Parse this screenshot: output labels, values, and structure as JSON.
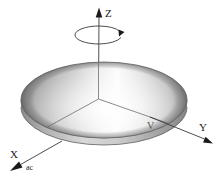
{
  "figure": {
    "background_color": "#ffffff",
    "width": 220,
    "height": 178
  },
  "axes": {
    "z": {
      "label": "Z",
      "icon": "arrow-up-icon",
      "direction": "up",
      "tip": {
        "x": 99,
        "y": 9
      },
      "origin": {
        "x": 98,
        "y": 99
      },
      "label_pos": {
        "x": 105,
        "y": 17
      }
    },
    "y": {
      "label": "Y",
      "icon": "arrow-down-right-icon",
      "direction": "lower-right",
      "tip": {
        "x": 211,
        "y": 143
      },
      "origin": {
        "x": 98,
        "y": 99
      },
      "label_pos": {
        "x": 201,
        "y": 130
      }
    },
    "x": {
      "label": "X",
      "icon": "arrow-down-left-icon",
      "direction": "lower-left",
      "tip": {
        "x": 11,
        "y": 170
      },
      "origin": {
        "x": 98,
        "y": 99
      },
      "label_pos": {
        "x": 12,
        "y": 158
      }
    }
  },
  "annotations": {
    "acceleration": {
      "label": "ac",
      "pos": {
        "x": 26,
        "y": 169
      }
    },
    "velocity": {
      "label": "V",
      "pos": {
        "x": 149,
        "y": 128
      }
    }
  },
  "rotation": {
    "name": "spin-arrow",
    "label": "",
    "center": {
      "x": 99,
      "y": 35
    },
    "rx": 24,
    "ry": 9,
    "direction": "clockwise-in-projection"
  },
  "disk": {
    "name": "rotating-disk",
    "shape": "cylinder",
    "center": {
      "x": 104,
      "y": 100
    },
    "rx": 83,
    "ry": 38,
    "thickness": 11,
    "top_fill_light": "#fcfcfc",
    "top_fill_mid": "#c9c9c9",
    "top_fill_dark": "#8f8f8f",
    "side_fill_light": "#d4d4d4",
    "side_fill_dark": "#8a8a8a",
    "outline_color": "#5d5d5d"
  },
  "colors": {
    "ink": "#1a1a1a",
    "axis": "#3a3a3a",
    "faint": "#6e6e6e",
    "background": "#ffffff"
  }
}
